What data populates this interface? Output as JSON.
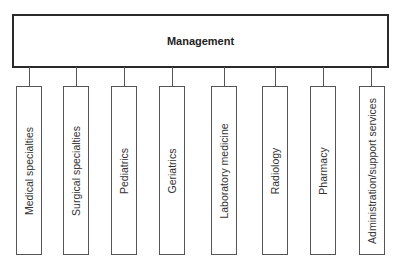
{
  "diagram": {
    "type": "org-chart",
    "root": {
      "label": "Management"
    },
    "children": [
      {
        "label": "Medical specialties",
        "x": 16,
        "cx": 29
      },
      {
        "label": "Surgical specialties",
        "x": 63,
        "cx": 76
      },
      {
        "label": "Pediatrics",
        "x": 111,
        "cx": 124
      },
      {
        "label": "Geriatrics",
        "x": 159,
        "cx": 172
      },
      {
        "label": "Laboratory medicine",
        "x": 211,
        "cx": 224
      },
      {
        "label": "Radiology",
        "x": 262,
        "cx": 275
      },
      {
        "label": "Pharmacy",
        "x": 310,
        "cx": 323
      },
      {
        "label": "Administration/support services",
        "x": 359,
        "cx": 371
      }
    ],
    "colors": {
      "border": "#2a2a2a",
      "line": "#555555",
      "text": "#222222"
    }
  }
}
